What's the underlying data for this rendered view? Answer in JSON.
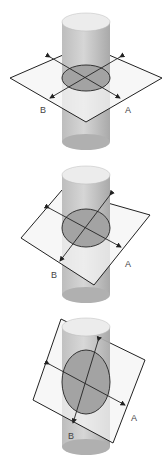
{
  "figure": {
    "panels": [
      {
        "id": "horizontal-cut",
        "label_a": "A",
        "label_b": "B",
        "section_shape": "circle"
      },
      {
        "id": "slight-tilt-cut",
        "label_a": "A",
        "label_b": "B",
        "section_shape": "near-circle"
      },
      {
        "id": "steep-tilt-cut",
        "label_a": "A",
        "label_b": "B",
        "section_shape": "ellipse"
      }
    ]
  },
  "colors": {
    "cylinder_top": "#e8e8e8",
    "cylinder_body": "#c8c8c8",
    "section_fill": "#9c9c9c",
    "plane_fill": "#f4f4f4",
    "outline": "#222222"
  }
}
